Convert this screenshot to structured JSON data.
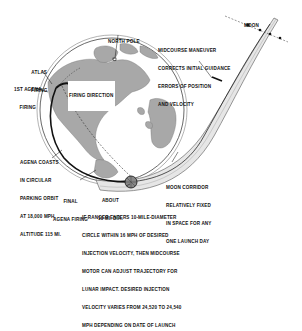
{
  "diagram": {
    "colors": {
      "background": "#ffffff",
      "ink": "#111111",
      "land": "#a8a8a8",
      "ocean": "#ffffff",
      "corridor_fill": "#e6e6e6",
      "trajectory": "#111111"
    },
    "labels": {
      "moon": "MOON",
      "north_pole": "NORTH POLE",
      "atlas_firing": [
        "ATLAS",
        "FIRING"
      ],
      "first_agena_firing": [
        "1ST AGENA",
        "FIRING"
      ],
      "firing_direction": "FIRING DIRECTION",
      "midcourse": [
        "MIDCOURSE MANEUVER",
        "CORRECTS INITIAL GUIDANCE",
        "ERRORS OF POSITION",
        "AND VELOCITY"
      ],
      "agena_coasts": [
        "AGENA COASTS",
        "IN CIRCULAR",
        "PARKING ORBIT",
        "AT 18,000 MPH,",
        "ALTITUDE 115 MI."
      ],
      "final_agena_firing": [
        "FINAL",
        "AGENA FIRING"
      ],
      "about_diameter": [
        "ABOUT",
        "10 MI. DIA."
      ],
      "moon_corridor": [
        "MOON CORRIDOR",
        "RELATIVELY FIXED",
        "IN SPACE FOR ANY",
        "ONE LAUNCH DAY"
      ],
      "ranger_note": [
        "IF RANGER ENTERS 10-MILE-DIAMETER",
        "CIRCLE WITHIN 16 MPH OF DESIRED",
        "INJECTION VELOCITY, THEN MIDCOURSE",
        "MOTOR CAN ADJUST TRAJECTORY FOR",
        "LUNAR IMPACT. DESIRED INJECTION",
        "VELOCITY VARIES FROM 24,520 TO 24,540",
        "MPH DEPENDING ON DATE OF LAUNCH"
      ]
    },
    "icons": {
      "earth": "earth-globe-icon",
      "moon": "moon-dot-icon",
      "injection_circle": "injection-circle-icon"
    }
  }
}
